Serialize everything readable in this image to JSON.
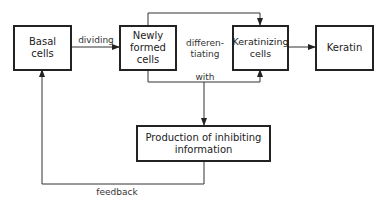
{
  "nodes": {
    "basal": {
      "label": "Basal cells",
      "line1": "Basal",
      "line2": "cells"
    },
    "newly": {
      "label": "Newly formed cells",
      "line1": "Newly",
      "line2": "formed",
      "line3": "cells"
    },
    "keratinizing": {
      "label": "Keratinizing cells",
      "line1": "Keratinizing",
      "line2": "cells"
    },
    "keratin": {
      "label": "Keratin"
    },
    "production": {
      "label": "Production of inhibiting information",
      "line1": "Production of inhibiting",
      "line2": "information"
    }
  },
  "edges": {
    "dividing": "dividing",
    "differentiating_1": "differen-",
    "differentiating_2": "tiating",
    "with": "with",
    "feedback": "feedback"
  }
}
